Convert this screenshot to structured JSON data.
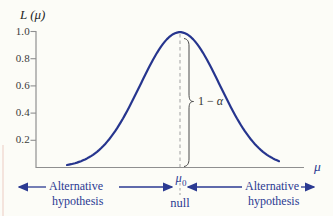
{
  "colors": {
    "curve": "#26358e",
    "navy_text": "#2b3a92",
    "axis_gray": "#8f8f8f",
    "dashed_gray": "#a0a0a0",
    "brace": "#4a4a4a",
    "background": "#fcfcf7"
  },
  "chart_data": {
    "type": "line",
    "ylabel": "L (μ)",
    "xlabel": "μ",
    "y_ticks": [
      1.0,
      0.8,
      0.6,
      0.4,
      0.2
    ],
    "ylim": [
      0,
      1.0
    ],
    "grid": false,
    "legend": "none",
    "curve": {
      "shape": "gaussian",
      "peak_value": 0.995,
      "center": "μ0",
      "description": "Symmetric bell-shaped curve peaking at L≈1.0 above μ0 and falling to ≈0 in both tails"
    },
    "x_marks": [
      {
        "label": "μ0",
        "sublabel": "null",
        "marker": "vertical dashed line at curve peak"
      }
    ],
    "annotations": [
      {
        "text": "1 − α",
        "kind": "brace",
        "extent": "vertical span from axis up to curve peak at μ0"
      },
      {
        "text": "Alternative hypothesis",
        "kind": "arrow-region",
        "position": "left of μ0, arrows pointing outward left and inward to μ0"
      },
      {
        "text": "Alternative hypothesis",
        "kind": "arrow-region",
        "position": "right of μ0, arrows pointing inward to μ0 and outward right"
      }
    ]
  },
  "labels": {
    "y_axis_title": "L (μ)",
    "x_axis_title": "μ",
    "y_tick_labels": [
      "1.0",
      "0.8",
      "0.6",
      "0.4",
      "0.2"
    ],
    "mu0_base": "μ",
    "mu0_sub": "0",
    "null_label": "null",
    "brace_pre": "1 − ",
    "brace_alpha": "α",
    "alt_left_line1": "Alternative",
    "alt_left_line2": "hypothesis",
    "alt_right_line1": "Alternative",
    "alt_right_line2": "hypothesis"
  }
}
